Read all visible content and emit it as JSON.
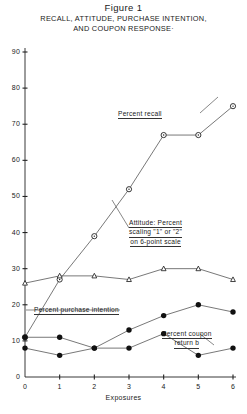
{
  "figure": {
    "title": "Figure 1",
    "subtitle_line1": "RECALL, ATTITUDE, PURCHASE INTENTION,",
    "subtitle_line2": "AND COUPON RESPONSE·"
  },
  "axes": {
    "xlabel": "Exposures",
    "ylabel": "",
    "x_ticks": [
      "0",
      "1",
      "2",
      "3",
      "4",
      "5",
      "6"
    ],
    "y_ticks": [
      "0",
      "10",
      "20",
      "30",
      "40",
      "50",
      "60",
      "70",
      "80",
      "90"
    ],
    "xlim": [
      0,
      6
    ],
    "ylim": [
      0,
      90
    ]
  },
  "annotations": {
    "recall": "Percent recall",
    "attitude_line1": "Attitude:  Percent",
    "attitude_line2": "scaling \"1\" or \"2\"",
    "attitude_line3": "on 6-point scale",
    "purchase": "Percent purchase intention",
    "coupon_line1": "Percent coupon",
    "coupon_line2": "return b"
  },
  "colors": {
    "ink": "#222222",
    "line": "#555555",
    "marker_open_fill": "#ffffff",
    "marker_solid_fill": "#111111"
  },
  "chart_data": {
    "type": "line",
    "title": "RECALL, ATTITUDE, PURCHASE INTENTION, AND COUPON RESPONSE",
    "xlabel": "Exposures",
    "ylabel": "Percent",
    "xlim": [
      0,
      6
    ],
    "ylim": [
      0,
      90
    ],
    "grid": false,
    "legend": "inline annotations",
    "x": [
      0,
      1,
      2,
      3,
      4,
      5,
      6
    ],
    "series": [
      {
        "name": "Percent recall",
        "marker": "open-circle",
        "values": [
          11,
          27,
          39,
          52,
          67,
          67,
          75
        ]
      },
      {
        "name": "Attitude: Percent scaling \"1\" or \"2\" on 6-point scale",
        "marker": "open-triangle",
        "values": [
          26,
          28,
          28,
          27,
          30,
          30,
          27
        ]
      },
      {
        "name": "Percent purchase intention",
        "marker": "solid-circle",
        "values": [
          11,
          11,
          8,
          13,
          17,
          20,
          18
        ]
      },
      {
        "name": "Percent coupon return b",
        "marker": "solid-circle",
        "values": [
          8,
          6,
          8,
          8,
          12,
          6,
          8
        ]
      }
    ]
  }
}
